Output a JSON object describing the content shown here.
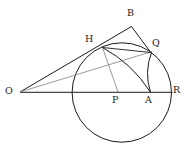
{
  "figure": {
    "background_color": "#ffffff",
    "stroke_color": "#1b1b1b",
    "faint_stroke_color": "#8a8a8a",
    "points": [
      {
        "name": "B",
        "label": "B",
        "x": 131,
        "y": 27,
        "label_x": 127,
        "label_y": 8
      },
      {
        "name": "H",
        "label": "H",
        "x": 103,
        "y": 48,
        "label_x": 85,
        "label_y": 35
      },
      {
        "name": "Q",
        "label": "Q",
        "x": 150.5,
        "y": 52,
        "label_x": 152,
        "label_y": 39
      },
      {
        "name": "O",
        "label": "O",
        "x": 20,
        "y": 92,
        "label_x": 5,
        "label_y": 86
      },
      {
        "name": "P",
        "label": "P",
        "x": 118,
        "y": 92,
        "label_x": 112,
        "label_y": 95
      },
      {
        "name": "A",
        "label": "A",
        "x": 150.5,
        "y": 92,
        "label_x": 146,
        "label_y": 95
      },
      {
        "name": "R",
        "label": "R",
        "x": 171.5,
        "y": 92,
        "label_x": 173,
        "label_y": 85
      }
    ],
    "circle": {
      "cx": 121.8,
      "cy": 92.5,
      "r": 49.7
    },
    "segments": [
      {
        "name": "segment-O-B",
        "from": "O",
        "to": "B",
        "shade": "dark"
      },
      {
        "name": "segment-B-Q",
        "from": "B",
        "to": "Q",
        "shade": "dark"
      },
      {
        "name": "segment-O-R",
        "from": "O",
        "to": "R",
        "shade": "dark"
      },
      {
        "name": "segment-O-Q",
        "from": "O",
        "to": "Q",
        "shade": "faint"
      },
      {
        "name": "segment-H-P",
        "from": "H",
        "to": "P",
        "shade": "faint"
      },
      {
        "name": "chord-H-Q",
        "from": "H",
        "to": "Q",
        "shade": "dark"
      }
    ],
    "arcs": [
      {
        "name": "arc-H-A",
        "note": "arc centered at O from H to A"
      },
      {
        "name": "arc-Q-A",
        "note": "arc from Q down to A"
      }
    ]
  }
}
